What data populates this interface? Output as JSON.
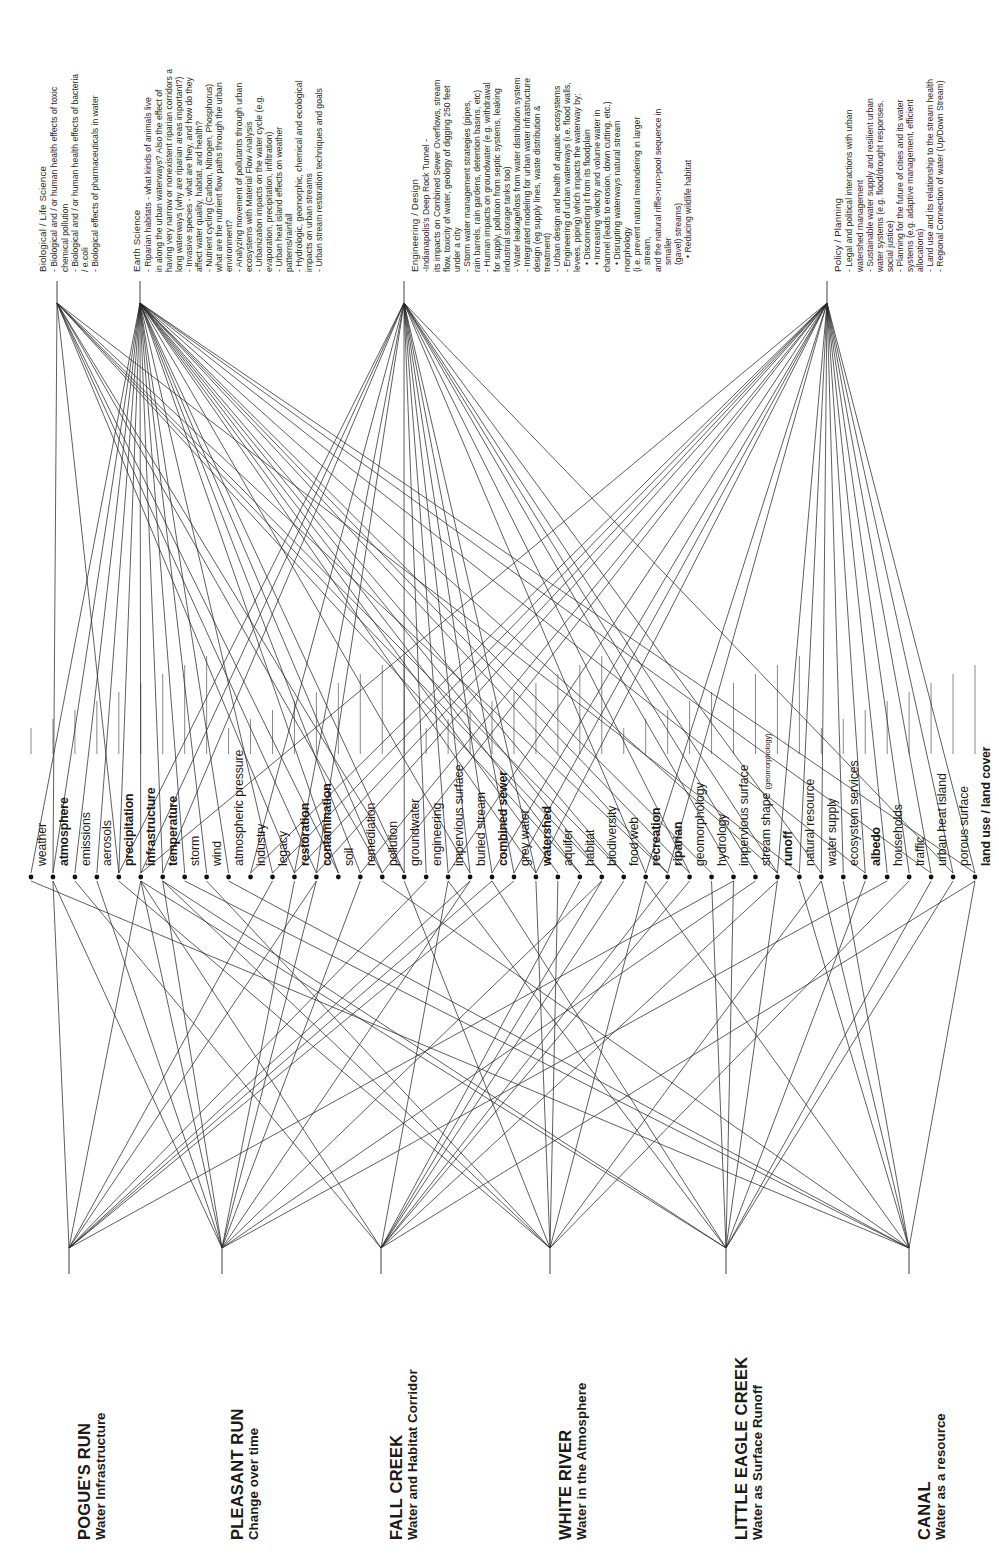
{
  "disciplines": [
    {
      "id": "bio",
      "name": "Biological / Life Science",
      "lines": [
        {
          "t": "- Biological and / or human health effects of toxic",
          "lvl": 0
        },
        {
          "t": "chemical pollution",
          "lvl": 0
        },
        {
          "t": "- Biological and / or human health effects of bacteria",
          "lvl": 0
        },
        {
          "t": "/ e.coli",
          "lvl": 0
        },
        {
          "t": "- Biological effects of pharmaceuticals in water",
          "lvl": 0
        }
      ]
    },
    {
      "id": "earth",
      "name": "Earth Science",
      "lines": [
        {
          "t": "- Riparian habitats - what kinds of animals live",
          "lvl": 0
        },
        {
          "t": "in along the urban waterways? Also the effect of",
          "lvl": 0
        },
        {
          "t": "having very narrow or nonexistent riparian corridors a",
          "lvl": 0
        },
        {
          "t": "long waterways (why are riparian areas important?)",
          "lvl": 0
        },
        {
          "t": "- Invasive species - what are they, and how do they",
          "lvl": 0
        },
        {
          "t": "affect water quality, habitat, and health?",
          "lvl": 0
        },
        {
          "t": "- Nutrient cycling (Carbon, Nitrogen, Phosphorus)",
          "lvl": 0
        },
        {
          "t": "what are the nutrient flow paths through the urban",
          "lvl": 0
        },
        {
          "t": "environment?",
          "lvl": 0
        },
        {
          "t": "- Analyzing movement of pollutants through urban",
          "lvl": 0
        },
        {
          "t": "ecosystems with Material Flow Analysis",
          "lvl": 0
        },
        {
          "t": "- Urbanization impacts on the water cycle (e.g.",
          "lvl": 0
        },
        {
          "t": "evaporation, precipitation, infiltration)",
          "lvl": 0
        },
        {
          "t": "- Urban heat island effects on weather",
          "lvl": 0
        },
        {
          "t": "patterns/rainfall",
          "lvl": 0
        },
        {
          "t": "- Hydrologic, geomorphic, chemical and ecological",
          "lvl": 0
        },
        {
          "t": "impacts on urban streams",
          "lvl": 0
        },
        {
          "t": "- Urban stream restoration techniques and goals",
          "lvl": 0
        }
      ]
    },
    {
      "id": "eng",
      "name": "Engineering / Design",
      "lines": [
        {
          "t": "-Indianapolis's Deep Rock Tunnel -",
          "lvl": 0
        },
        {
          "t": "its impacts on Combined Sewer Overflows, stream",
          "lvl": 0
        },
        {
          "t": "flow, toxicity of water, geology of digging 250 feet",
          "lvl": 0
        },
        {
          "t": "under a city",
          "lvl": 0
        },
        {
          "t": "- Storm water management strategies     (pipes,",
          "lvl": 0
        },
        {
          "t": "rain barrels, rain gardens, detention basins, etc)",
          "lvl": 0
        },
        {
          "t": "- Human impacts on groundwater (e.g. withdrawal",
          "lvl": 0
        },
        {
          "t": "for supply, pollution from septic systems, leaking",
          "lvl": 0
        },
        {
          "t": "industrial storage tanks too)",
          "lvl": 0
        },
        {
          "t": "- Water leakage/loss from water distribution system",
          "lvl": 0
        },
        {
          "t": "- Integrated modeling for urban water infrastructure",
          "lvl": 0
        },
        {
          "t": "design (eg supply lines, waste distribution &",
          "lvl": 0
        },
        {
          "t": "treatment)",
          "lvl": 0
        },
        {
          "t": "- Urban design and health of aquatic ecosystems",
          "lvl": 0
        },
        {
          "t": "- Engineering of urban waterways (i.e. flood walls,",
          "lvl": 0
        },
        {
          "t": "levees, piping) which impacts the waterway by:",
          "lvl": 0
        },
        {
          "t": "• Disconnecting it from its floodplain",
          "lvl": 1
        },
        {
          "t": "• Increasing velocity and volume water in",
          "lvl": 1
        },
        {
          "t": "channel (leads to erosion, down cutting, etc.)",
          "lvl": 0
        },
        {
          "t": "• Disrupting waterways natural stream",
          "lvl": 1
        },
        {
          "t": "morphology",
          "lvl": 0
        },
        {
          "t": "(i.e. prevent natural meandering in larger",
          "lvl": 0
        },
        {
          "t": "stream,",
          "lvl": 1
        },
        {
          "t": "and the natural riffle>run>pool sequence in",
          "lvl": 0
        },
        {
          "t": "smaller",
          "lvl": 1
        },
        {
          "t": "(gavel) streams)",
          "lvl": 1
        },
        {
          "t": "• Reducing wildlife habitat",
          "lvl": 2
        }
      ]
    },
    {
      "id": "policy",
      "name": "Policy / Planning",
      "lines": [
        {
          "t": "- Legal and political interactions with urban",
          "lvl": 0
        },
        {
          "t": "watershed management",
          "lvl": 0
        },
        {
          "t": "- Sustainable water supply and resilient urban",
          "lvl": 0
        },
        {
          "t": "water systems (e.g. flood/drought responses.",
          "lvl": 0
        },
        {
          "t": "social justice)",
          "lvl": 0
        },
        {
          "t": "- Planning for the future of cities and its water",
          "lvl": 0
        },
        {
          "t": "systems (e.g. adaptive management,      efficient",
          "lvl": 0
        },
        {
          "t": "allocations)",
          "lvl": 0
        },
        {
          "t": "- Land use and its relationship to the stream health",
          "lvl": 0
        },
        {
          "t": "- Regional Connection of water (Up/Down Stream)",
          "lvl": 0
        }
      ]
    }
  ],
  "keywords": [
    {
      "label": "weather",
      "bold": false
    },
    {
      "label": "atmosphere",
      "bold": true
    },
    {
      "label": "emissions",
      "bold": false
    },
    {
      "label": "aerosols",
      "bold": false
    },
    {
      "label": "precipitation",
      "bold": true
    },
    {
      "label": "infrastructure",
      "bold": true
    },
    {
      "label": "temperature",
      "bold": true
    },
    {
      "label": "storm",
      "bold": false
    },
    {
      "label": "wind",
      "bold": false
    },
    {
      "label": "atmospheric pressure",
      "bold": false
    },
    {
      "label": "industry",
      "bold": false
    },
    {
      "label": "legacy",
      "bold": false
    },
    {
      "label": "restoration",
      "bold": true
    },
    {
      "label": "contamination",
      "bold": true
    },
    {
      "label": "soil",
      "bold": false
    },
    {
      "label": "remediation",
      "bold": false
    },
    {
      "label": "pollution",
      "bold": false
    },
    {
      "label": "groundwater",
      "bold": false
    },
    {
      "label": "engineering",
      "bold": false
    },
    {
      "label": "impervious surface",
      "bold": false
    },
    {
      "label": "buried stream",
      "bold": false
    },
    {
      "label": "combined sewer",
      "bold": true
    },
    {
      "label": "grey water",
      "bold": false
    },
    {
      "label": "watershed",
      "bold": true
    },
    {
      "label": "aquifer",
      "bold": false
    },
    {
      "label": "habitat",
      "bold": false
    },
    {
      "label": "biodiversity",
      "bold": false
    },
    {
      "label": "food web",
      "bold": false
    },
    {
      "label": "recreation",
      "bold": true
    },
    {
      "label": "riparian",
      "bold": true
    },
    {
      "label": "geomorphology",
      "bold": false
    },
    {
      "label": "hydrology",
      "bold": false
    },
    {
      "label": "impervious surface",
      "bold": false
    },
    {
      "label": "stream shape (geomorphology)",
      "bold": false,
      "suffix": "(geomorphology)"
    },
    {
      "label": "runoff",
      "bold": true
    },
    {
      "label": "natural resource",
      "bold": false
    },
    {
      "label": "water supply",
      "bold": false
    },
    {
      "label": "ecosystem services",
      "bold": false
    },
    {
      "label": "albedo",
      "bold": true
    },
    {
      "label": "households",
      "bold": false
    },
    {
      "label": "traffic",
      "bold": false
    },
    {
      "label": "urban heat island",
      "bold": false
    },
    {
      "label": "porous surface",
      "bold": false
    },
    {
      "label": "land use / land cover",
      "bold": true
    }
  ],
  "waterways": [
    {
      "name": "POGUE'S RUN",
      "theme": "Water Infrastructure"
    },
    {
      "name": "PLEASANT RUN",
      "theme": "Change over time"
    },
    {
      "name": "FALL CREEK",
      "theme": "Water and Habitat Corridor"
    },
    {
      "name": "WHITE RIVER",
      "theme": "Water in the Atmosphere"
    },
    {
      "name": "LITTLE EAGLE CREEK",
      "theme": "Water as Surface Runoff"
    },
    {
      "name": "CANAL",
      "theme": "Water as a resource"
    }
  ],
  "edges_discipline_to_keyword": [
    [
      0,
      1
    ],
    [
      0,
      4
    ],
    [
      0,
      12
    ],
    [
      0,
      13
    ],
    [
      0,
      14
    ],
    [
      0,
      16
    ],
    [
      0,
      17
    ],
    [
      0,
      25
    ],
    [
      0,
      26
    ],
    [
      0,
      27
    ],
    [
      0,
      29
    ],
    [
      0,
      35
    ],
    [
      1,
      0
    ],
    [
      1,
      1
    ],
    [
      1,
      2
    ],
    [
      1,
      3
    ],
    [
      1,
      4
    ],
    [
      1,
      5
    ],
    [
      1,
      6
    ],
    [
      1,
      7
    ],
    [
      1,
      8
    ],
    [
      1,
      9
    ],
    [
      1,
      11
    ],
    [
      1,
      14
    ],
    [
      1,
      15
    ],
    [
      1,
      16
    ],
    [
      1,
      17
    ],
    [
      1,
      20
    ],
    [
      1,
      23
    ],
    [
      1,
      24
    ],
    [
      1,
      25
    ],
    [
      1,
      26
    ],
    [
      1,
      27
    ],
    [
      1,
      29
    ],
    [
      1,
      30
    ],
    [
      1,
      31
    ],
    [
      1,
      34
    ],
    [
      1,
      38
    ],
    [
      1,
      41
    ],
    [
      1,
      43
    ],
    [
      2,
      4
    ],
    [
      2,
      5
    ],
    [
      2,
      6
    ],
    [
      2,
      10
    ],
    [
      2,
      12
    ],
    [
      2,
      13
    ],
    [
      2,
      17
    ],
    [
      2,
      18
    ],
    [
      2,
      19
    ],
    [
      2,
      20
    ],
    [
      2,
      21
    ],
    [
      2,
      22
    ],
    [
      2,
      23
    ],
    [
      2,
      28
    ],
    [
      2,
      30
    ],
    [
      2,
      32
    ],
    [
      2,
      33
    ],
    [
      2,
      34
    ],
    [
      2,
      36
    ],
    [
      2,
      42
    ],
    [
      3,
      5
    ],
    [
      3,
      10
    ],
    [
      3,
      11
    ],
    [
      3,
      12
    ],
    [
      3,
      13
    ],
    [
      3,
      15
    ],
    [
      3,
      16
    ],
    [
      3,
      19
    ],
    [
      3,
      21
    ],
    [
      3,
      22
    ],
    [
      3,
      23
    ],
    [
      3,
      28
    ],
    [
      3,
      29
    ],
    [
      3,
      34
    ],
    [
      3,
      35
    ],
    [
      3,
      36
    ],
    [
      3,
      37
    ],
    [
      3,
      38
    ],
    [
      3,
      39
    ],
    [
      3,
      40
    ],
    [
      3,
      41
    ],
    [
      3,
      42
    ],
    [
      3,
      43
    ]
  ],
  "edges_waterway_to_keyword": [
    [
      0,
      1
    ],
    [
      0,
      5
    ],
    [
      0,
      11
    ],
    [
      0,
      13
    ],
    [
      0,
      18
    ],
    [
      0,
      20
    ],
    [
      0,
      21
    ],
    [
      0,
      22
    ],
    [
      0,
      32
    ],
    [
      1,
      1
    ],
    [
      1,
      3
    ],
    [
      1,
      5
    ],
    [
      1,
      6
    ],
    [
      1,
      12
    ],
    [
      1,
      13
    ],
    [
      1,
      15
    ],
    [
      1,
      20
    ],
    [
      1,
      26
    ],
    [
      1,
      33
    ],
    [
      1,
      39
    ],
    [
      2,
      2
    ],
    [
      2,
      5
    ],
    [
      2,
      19
    ],
    [
      2,
      25
    ],
    [
      2,
      26
    ],
    [
      2,
      27
    ],
    [
      2,
      29
    ],
    [
      2,
      30
    ],
    [
      2,
      34
    ],
    [
      2,
      43
    ],
    [
      3,
      4
    ],
    [
      3,
      6
    ],
    [
      3,
      8
    ],
    [
      3,
      17
    ],
    [
      3,
      23
    ],
    [
      3,
      24
    ],
    [
      3,
      28
    ],
    [
      3,
      36
    ],
    [
      3,
      40
    ],
    [
      4,
      5
    ],
    [
      4,
      6
    ],
    [
      4,
      19
    ],
    [
      4,
      21
    ],
    [
      4,
      31
    ],
    [
      4,
      32
    ],
    [
      4,
      34
    ],
    [
      4,
      38
    ],
    [
      4,
      41
    ],
    [
      4,
      42
    ],
    [
      5,
      0
    ],
    [
      5,
      7
    ],
    [
      5,
      9
    ],
    [
      5,
      16
    ],
    [
      5,
      28
    ],
    [
      5,
      35
    ],
    [
      5,
      36
    ],
    [
      5,
      37
    ],
    [
      5,
      43
    ]
  ],
  "colors": {
    "ink": "#1a1a1a",
    "line": "#2a2a2a",
    "muted": "#555555"
  }
}
